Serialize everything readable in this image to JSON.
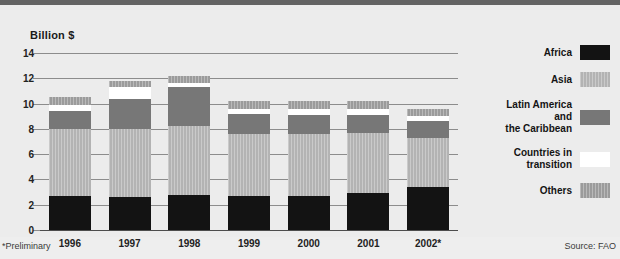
{
  "axis_title": "Billion $",
  "footnotes": {
    "left": "*Preliminary",
    "right": "Source: FAO"
  },
  "legend": {
    "items": [
      {
        "label": "Africa",
        "key": "africa",
        "color": "#131313"
      },
      {
        "label": "Asia",
        "key": "asia",
        "color": "#b3b3b3"
      },
      {
        "label": "Latin America\nand\nthe Caribbean",
        "key": "latam",
        "color": "#777777"
      },
      {
        "label": "Countries in\ntransition",
        "key": "transition",
        "color": "#ffffff"
      },
      {
        "label": "Others",
        "key": "others",
        "color": "#9b9b9b"
      }
    ]
  },
  "chart_data": {
    "type": "bar",
    "stacked": true,
    "title": "",
    "subtitle": "",
    "xlabel": "",
    "ylabel": "Billion $",
    "ylim": [
      0,
      14
    ],
    "yticks": [
      0,
      2,
      4,
      6,
      8,
      10,
      12,
      14
    ],
    "ytick_labels": [
      "0",
      "2",
      "4",
      "6",
      "8",
      "10",
      "12",
      "14"
    ],
    "grid": true,
    "legend_position": "right",
    "categories": [
      "1996",
      "1997",
      "1998",
      "1999",
      "2000",
      "2001",
      "2002*"
    ],
    "series": [
      {
        "name": "Africa",
        "values": [
          2.7,
          2.6,
          2.8,
          2.7,
          2.7,
          2.9,
          3.4
        ]
      },
      {
        "name": "Asia",
        "values": [
          5.3,
          5.4,
          5.4,
          4.9,
          4.9,
          4.8,
          3.9
        ]
      },
      {
        "name": "Latin America and the Caribbean",
        "values": [
          1.4,
          2.4,
          3.1,
          1.6,
          1.5,
          1.4,
          1.3
        ]
      },
      {
        "name": "Countries in transition",
        "values": [
          0.5,
          0.9,
          0.3,
          0.4,
          0.5,
          0.5,
          0.4
        ]
      },
      {
        "name": "Others",
        "values": [
          0.6,
          0.5,
          0.6,
          0.6,
          0.6,
          0.6,
          0.6
        ]
      }
    ],
    "totals": [
      10.5,
      11.8,
      12.2,
      10.2,
      10.2,
      10.2,
      9.6
    ],
    "annotations": [
      "*Preliminary",
      "Source: FAO"
    ]
  }
}
